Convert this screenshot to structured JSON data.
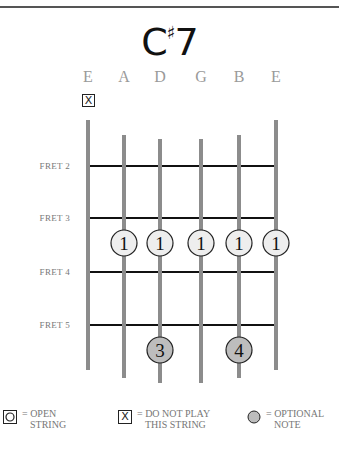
{
  "chord": {
    "root": "C",
    "accidental": "♯",
    "quality": "7"
  },
  "strings": [
    {
      "name": "E",
      "x": 88,
      "top": 120,
      "bottom": 370,
      "marker": "do-not-play"
    },
    {
      "name": "A",
      "x": 124,
      "top": 135,
      "bottom": 378,
      "marker": ""
    },
    {
      "name": "D",
      "x": 160,
      "top": 139,
      "bottom": 383,
      "marker": ""
    },
    {
      "name": "G",
      "x": 201,
      "top": 139,
      "bottom": 383,
      "marker": ""
    },
    {
      "name": "B",
      "x": 239,
      "top": 135,
      "bottom": 378,
      "marker": ""
    },
    {
      "name": "E",
      "x": 276,
      "top": 120,
      "bottom": 370,
      "marker": ""
    }
  ],
  "frets": [
    {
      "label": "FRET 2",
      "y": 166
    },
    {
      "label": "FRET 3",
      "y": 218
    },
    {
      "label": "FRET 4",
      "y": 272
    },
    {
      "label": "FRET 5",
      "y": 325
    }
  ],
  "notes": [
    {
      "string": 1,
      "y": 243,
      "finger": "1",
      "optional": false
    },
    {
      "string": 2,
      "y": 243,
      "finger": "1",
      "optional": false
    },
    {
      "string": 3,
      "y": 243,
      "finger": "1",
      "optional": false
    },
    {
      "string": 4,
      "y": 243,
      "finger": "1",
      "optional": false
    },
    {
      "string": 5,
      "y": 243,
      "finger": "1",
      "optional": false
    },
    {
      "string": 2,
      "y": 350,
      "finger": "3",
      "optional": true
    },
    {
      "string": 4,
      "y": 350,
      "finger": "4",
      "optional": true
    }
  ],
  "mute_symbol": "X",
  "legend": {
    "open": {
      "line1": "= OPEN",
      "line2": "STRING"
    },
    "mute": {
      "line1": "= DO NOT PLAY",
      "line2": "THIS STRING",
      "symbol": "X"
    },
    "optional": {
      "line1": "= OPTIONAL",
      "line2": "NOTE"
    }
  },
  "colors": {
    "string": "#8c8c8c",
    "fret": "#111111",
    "note_fill": "#eeeeee",
    "optional_fill": "#bdbdbd",
    "note_stroke": "#222222"
  }
}
